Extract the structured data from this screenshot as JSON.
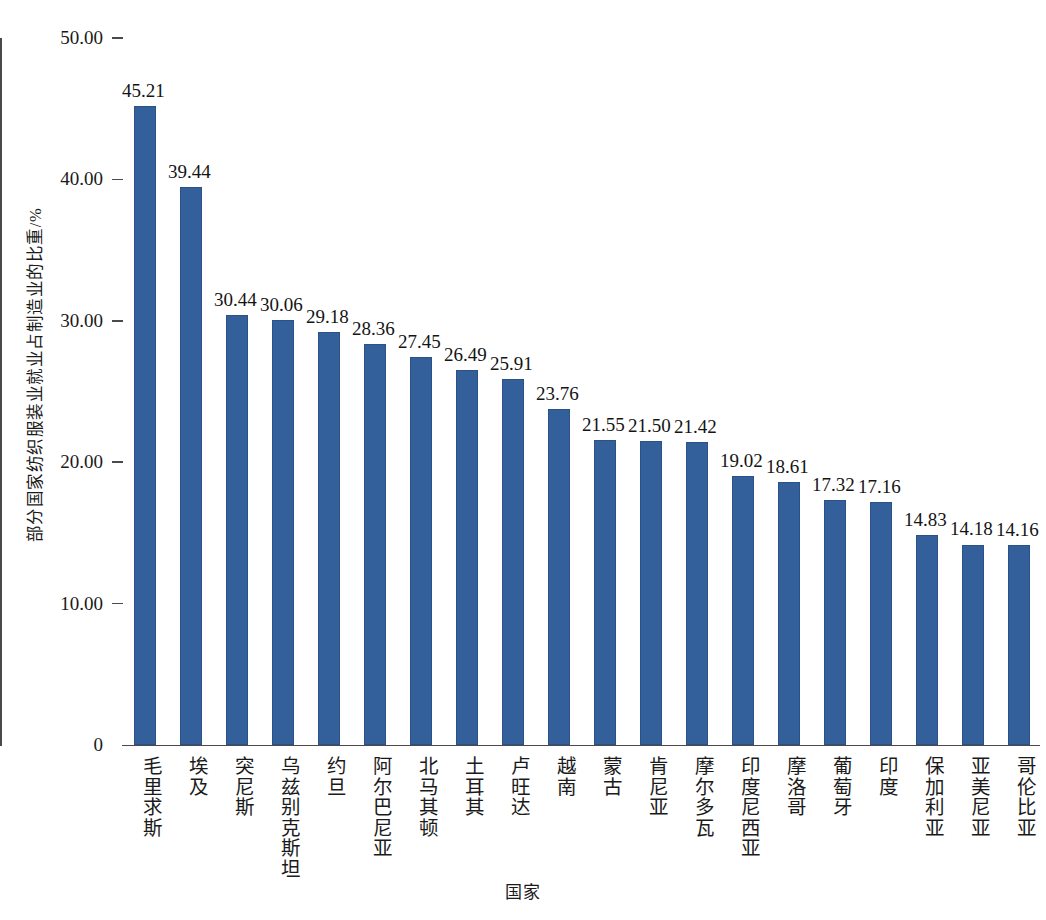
{
  "chart_data": {
    "type": "bar",
    "title": "",
    "xlabel": "国家",
    "ylabel": "部分国家纺织服装业就业占制造业的比重/%",
    "ylim": [
      0,
      50
    ],
    "ytick_labels": [
      "0",
      "10.00",
      "20.00",
      "30.00",
      "40.00",
      "50.00"
    ],
    "ytick_values": [
      0,
      10,
      20,
      30,
      40,
      50
    ],
    "grid": false,
    "legend": null,
    "bar_color": "#33609a",
    "categories": [
      "毛里求斯",
      "埃及",
      "突尼斯",
      "乌兹别克斯坦",
      "约旦",
      "阿尔巴尼亚",
      "北马其顿",
      "土耳其",
      "卢旺达",
      "越南",
      "蒙古",
      "肯尼亚",
      "摩尔多瓦",
      "印度尼西亚",
      "摩洛哥",
      "葡萄牙",
      "印度",
      "保加利亚",
      "亚美尼亚",
      "哥伦比亚"
    ],
    "values": [
      45.21,
      39.44,
      30.44,
      30.06,
      29.18,
      28.36,
      27.45,
      26.49,
      25.91,
      23.76,
      21.55,
      21.5,
      21.42,
      19.02,
      18.61,
      17.32,
      17.16,
      14.83,
      14.18,
      14.16
    ],
    "value_labels": [
      "45.21",
      "39.44",
      "30.44",
      "30.06",
      "29.18",
      "28.36",
      "27.45",
      "26.49",
      "25.91",
      "23.76",
      "21.55",
      "21.50",
      "21.42",
      "19.02",
      "18.61",
      "17.32",
      "17.16",
      "14.83",
      "14.18",
      "14.16"
    ]
  }
}
